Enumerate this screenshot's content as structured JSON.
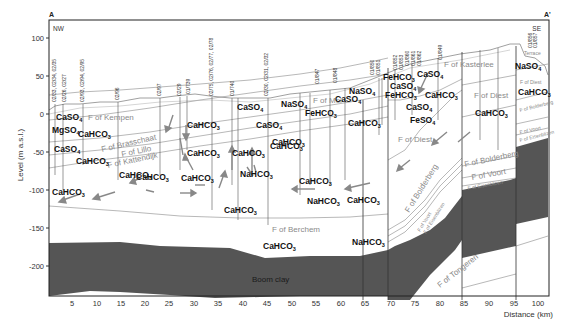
{
  "figure": {
    "section_start_label": "A",
    "section_end_label": "A'",
    "direction_left": "NW",
    "direction_right": "SE",
    "y_axis_label": "Level (m a.s.l.)",
    "x_axis_label": "Distance (km)",
    "y_ticks": [
      "100",
      "50",
      "0",
      "-50",
      "-100",
      "-150",
      "-200"
    ],
    "x_ticks": [
      "5",
      "10",
      "15",
      "20",
      "25",
      "30",
      "35",
      "40",
      "45",
      "50",
      "55",
      "60",
      "65",
      "70",
      "75",
      "80",
      "85",
      "90",
      "95",
      "100"
    ],
    "formations": {
      "kempen": "F of Kempen",
      "brasschaat": "F of Brasschaat",
      "lillo": "F of Lillo",
      "kattendijk": "F of Kattendijk",
      "mol": "F of Mol",
      "berchem": "F of Berchem",
      "boom": "Boom clay",
      "kasterlee": "F of Kasterlee",
      "diest_1": "F of Diest",
      "diest_2": "F of Diest",
      "diest_3": "F of Diest",
      "bolderberg_1": "F of Bolderberg",
      "bolderberg_2": "F of Bolderberg",
      "bolderberg_3": "F of Bolderberg",
      "voort_1": "F of Voort",
      "voort_2": "F of Voort",
      "voort_3": "F of Voort",
      "eisden_1": "F of Eisenblizen",
      "eisden_2": "F of Eisenblizen",
      "eisden_3": "F of Eisenblizen",
      "tongeren": "F of Tongeren",
      "terrace": "Terrace"
    },
    "wells": [
      "02/33, 02/34, 02/35",
      "02/26, 02/27",
      "02/93, 02/94, 02/95",
      "02/96",
      "02/97",
      "02/29",
      "01/739",
      "02/75, 02/76, 02/77, 02/78",
      "01/740",
      "02/30, 02/31, 02/32",
      "01/847",
      "01/848",
      "01/850",
      "01/851",
      "01/852",
      "01/853",
      "01/860",
      "01/861",
      "01/862",
      "01/849",
      "01/856",
      "01/857"
    ],
    "water_types": [
      {
        "id": "w1",
        "main": "CaSO",
        "sub": "4"
      },
      {
        "id": "w2",
        "main": "MgSO",
        "sub": "4"
      },
      {
        "id": "w3",
        "main": "CaHCO",
        "sub": "3"
      },
      {
        "id": "w4",
        "main": "CaSO",
        "sub": "4"
      },
      {
        "id": "w5",
        "main": "CaHCO",
        "sub": "3"
      },
      {
        "id": "w6",
        "main": "CaHCO",
        "sub": "3"
      },
      {
        "id": "w7",
        "main": "CaHCO",
        "sub": "3"
      },
      {
        "id": "w8",
        "main": "CaHCO",
        "sub": "3"
      },
      {
        "id": "w9",
        "main": "CaHCO",
        "sub": "3"
      },
      {
        "id": "w10",
        "main": "CaHCO",
        "sub": "3"
      },
      {
        "id": "w11",
        "main": "CaSO",
        "sub": "4"
      },
      {
        "id": "w12",
        "main": "CaSO",
        "sub": "4"
      },
      {
        "id": "w13",
        "main": "CaHCO",
        "sub": "3"
      },
      {
        "id": "w14",
        "main": "CaHCO",
        "sub": "3"
      },
      {
        "id": "w15",
        "main": "NaHCO",
        "sub": "3"
      },
      {
        "id": "w16",
        "main": "CaHCO",
        "sub": "3"
      },
      {
        "id": "w17",
        "main": "CaHCO",
        "sub": "3"
      },
      {
        "id": "w18",
        "main": "NaSO",
        "sub": "4"
      },
      {
        "id": "w19",
        "main": "FeHCO",
        "sub": "3"
      },
      {
        "id": "w20",
        "main": "CaSO",
        "sub": "4"
      },
      {
        "id": "w21",
        "main": "NaSO",
        "sub": "4"
      },
      {
        "id": "w22",
        "main": "CaHCO",
        "sub": "3"
      },
      {
        "id": "w23",
        "main": "CaHCO",
        "sub": "3"
      },
      {
        "id": "w24",
        "main": "CaHCO",
        "sub": "3"
      },
      {
        "id": "w25",
        "main": "NaHCO",
        "sub": "3"
      },
      {
        "id": "w26",
        "main": "CaHCO",
        "sub": "3"
      },
      {
        "id": "w27",
        "main": "CaHCO",
        "sub": "3"
      },
      {
        "id": "w28",
        "main": "NaHCO",
        "sub": "3"
      },
      {
        "id": "w29",
        "main": "FeHCO",
        "sub": "3"
      },
      {
        "id": "w30",
        "main": "CaSO",
        "sub": "4"
      },
      {
        "id": "w31",
        "main": "FeHCO",
        "sub": "3"
      },
      {
        "id": "w32",
        "main": "CaSO",
        "sub": "4"
      },
      {
        "id": "w33",
        "main": "CaHCO",
        "sub": "3"
      },
      {
        "id": "w34",
        "main": "CaSO",
        "sub": "4"
      },
      {
        "id": "w35",
        "main": "FeSO",
        "sub": "4"
      },
      {
        "id": "w36",
        "main": "CaHCO",
        "sub": "3"
      },
      {
        "id": "w37",
        "main": "NaSO",
        "sub": "4"
      },
      {
        "id": "w38",
        "main": "CaHCO",
        "sub": "3"
      },
      {
        "id": "w39",
        "main": "CaHCO",
        "sub": "3"
      }
    ]
  }
}
